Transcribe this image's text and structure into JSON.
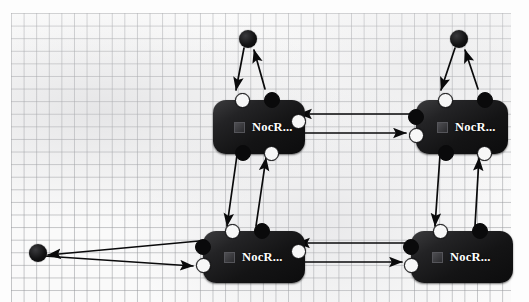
{
  "canvas": {
    "name": "graph-editor-canvas",
    "background_style": "graph-paper",
    "grid_color": "#96989c",
    "paper_color": "#fafafa",
    "width": 529,
    "height": 302
  },
  "node_style": {
    "body_color": "#141415",
    "label_color": "#ffffff",
    "port_white_color": "#f7f7f7",
    "port_black_color": "#0a0a0b"
  },
  "nodes": [
    {
      "id": "node-top-left",
      "label": "NocR...",
      "icon": "square-badge-icon",
      "x": 213,
      "y": 100,
      "width": 92,
      "height": 54,
      "ports": [
        {
          "id": "tl-port-top-left",
          "kind": "white",
          "x": 22,
          "y": -7
        },
        {
          "id": "tl-port-top-right",
          "kind": "black",
          "x": 51,
          "y": -8
        },
        {
          "id": "tl-port-right",
          "kind": "white",
          "x": 78,
          "y": 14
        },
        {
          "id": "tl-port-bottom-left",
          "kind": "black",
          "x": 22,
          "y": 45
        },
        {
          "id": "tl-port-bottom-right",
          "kind": "white",
          "x": 51,
          "y": 46
        }
      ]
    },
    {
      "id": "node-top-right",
      "label": "NocR...",
      "icon": "square-badge-icon",
      "x": 416,
      "y": 100,
      "width": 92,
      "height": 54,
      "ports": [
        {
          "id": "tr-port-top-left",
          "kind": "white",
          "x": 22,
          "y": -7
        },
        {
          "id": "tr-port-top-right",
          "kind": "black",
          "x": 61,
          "y": -8
        },
        {
          "id": "tr-port-left-upper",
          "kind": "black",
          "x": -8,
          "y": 9
        },
        {
          "id": "tr-port-left-lower",
          "kind": "white",
          "x": -7,
          "y": 28
        },
        {
          "id": "tr-port-bottom-left",
          "kind": "black",
          "x": 22,
          "y": 45
        },
        {
          "id": "tr-port-bottom-right",
          "kind": "white",
          "x": 61,
          "y": 46
        }
      ]
    },
    {
      "id": "node-bottom-left",
      "label": "NocR...",
      "icon": "square-badge-icon",
      "x": 203,
      "y": 231,
      "width": 102,
      "height": 52,
      "ports": [
        {
          "id": "bl-port-top-left",
          "kind": "white",
          "x": 22,
          "y": -7
        },
        {
          "id": "bl-port-top-right",
          "kind": "black",
          "x": 51,
          "y": -8
        },
        {
          "id": "bl-port-left-upper",
          "kind": "black",
          "x": -8,
          "y": 8
        },
        {
          "id": "bl-port-left-lower",
          "kind": "white",
          "x": -7,
          "y": 27
        },
        {
          "id": "bl-port-right",
          "kind": "white",
          "x": 88,
          "y": 13
        }
      ]
    },
    {
      "id": "node-bottom-right",
      "label": "NocR...",
      "icon": "square-badge-icon",
      "x": 411,
      "y": 231,
      "width": 102,
      "height": 52,
      "ports": [
        {
          "id": "br-port-top-left",
          "kind": "white",
          "x": 22,
          "y": -7
        },
        {
          "id": "br-port-top-right",
          "kind": "black",
          "x": 61,
          "y": -8
        },
        {
          "id": "br-port-left-upper",
          "kind": "black",
          "x": -8,
          "y": 8
        },
        {
          "id": "br-port-left-lower",
          "kind": "white",
          "x": -7,
          "y": 27
        }
      ]
    }
  ],
  "endpoints": [
    {
      "id": "endpoint-top-left",
      "x": 248,
      "y": 39,
      "r": 9
    },
    {
      "id": "endpoint-top-right",
      "x": 459,
      "y": 39,
      "r": 9
    },
    {
      "id": "endpoint-left",
      "x": 38,
      "y": 253,
      "r": 9
    }
  ],
  "edges": [
    {
      "id": "edge-endpoint-tl-to-tlnode",
      "from": "endpoint-top-left",
      "to": "node-top-left:top-left",
      "d": "M 244 48 L 236 90",
      "arrow_at": "end"
    },
    {
      "id": "edge-tlnode-to-endpoint-tl",
      "from": "node-top-left:top-right",
      "to": "endpoint-top-left",
      "d": "M 265 89 L 254 50",
      "arrow_at": "end"
    },
    {
      "id": "edge-endpoint-tr-to-trnode",
      "from": "endpoint-top-right",
      "to": "node-top-right:top-left",
      "d": "M 455 48 L 441 90",
      "arrow_at": "end"
    },
    {
      "id": "edge-trnode-to-endpoint-tr",
      "from": "node-top-right:top-right",
      "to": "endpoint-top-right",
      "d": "M 478 89 L 465 50",
      "arrow_at": "end"
    },
    {
      "id": "edge-trnode-to-tlnode",
      "from": "node-top-right:left-upper",
      "to": "node-top-left:right",
      "d": "M 410 114 L 299 114",
      "arrow_at": "end"
    },
    {
      "id": "edge-tlnode-to-trnode",
      "from": "node-top-left:right-lower",
      "to": "node-top-right:left-lower",
      "d": "M 303 133 L 406 133",
      "arrow_at": "end"
    },
    {
      "id": "edge-tlnode-down-to-blnode",
      "from": "node-top-left:bottom-left",
      "to": "node-bottom-left:top-left",
      "d": "M 237 155 L 227 226",
      "arrow_at": "end"
    },
    {
      "id": "edge-blnode-up-to-tlnode",
      "from": "node-bottom-left:top-right",
      "to": "node-top-left:bottom-right",
      "d": "M 256 226 L 266 158",
      "arrow_at": "end"
    },
    {
      "id": "edge-trnode-down-to-brnode",
      "from": "node-top-right:bottom-left",
      "to": "node-bottom-right:top-left",
      "d": "M 440 155 L 435 226",
      "arrow_at": "end"
    },
    {
      "id": "edge-brnode-up-to-trnode",
      "from": "node-bottom-right:top-right",
      "to": "node-top-right:bottom-right",
      "d": "M 475 226 L 479 158",
      "arrow_at": "end"
    },
    {
      "id": "edge-brnode-to-blnode",
      "from": "node-bottom-right:left-upper",
      "to": "node-bottom-left:right",
      "d": "M 405 243 L 297 243",
      "arrow_at": "end"
    },
    {
      "id": "edge-blnode-to-brnode",
      "from": "node-bottom-left:right-lower",
      "to": "node-bottom-right:left-lower",
      "d": "M 300 262 L 402 262",
      "arrow_at": "end"
    },
    {
      "id": "edge-blnode-to-endpoint-left",
      "from": "node-bottom-left:left-upper",
      "to": "endpoint-left",
      "d": "M 199 241 L 48 255",
      "arrow_at": "end"
    },
    {
      "id": "edge-endpoint-left-to-blnode",
      "from": "endpoint-left",
      "to": "node-bottom-left:left-lower",
      "d": "M 44 256 L 193 266",
      "arrow_at": "end"
    }
  ]
}
